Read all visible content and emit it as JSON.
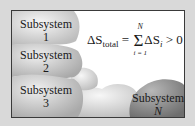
{
  "diagram": {
    "subsystems": [
      {
        "label": "Subsystem",
        "index": "1"
      },
      {
        "label": "Subsystem",
        "index": "2"
      },
      {
        "label": "Subsystem",
        "index": "3"
      },
      {
        "label": "Subsystem",
        "index": "N"
      }
    ],
    "equation": {
      "lhs_delta": "ΔS",
      "lhs_sub": "total",
      "equals": "=",
      "sum_symbol": "Σ",
      "sum_upper": "N",
      "sum_lower": "i = 1",
      "term_delta": "ΔS",
      "term_sub": "i",
      "relation": "> 0"
    },
    "colors": {
      "background": "#d9d9d9",
      "frame_border": "#3a3a3a",
      "subsystem_light": "#e6e6e6",
      "subsystem_mid": "#c8c8c8",
      "subsystem_dark": "#8a8a8a"
    }
  }
}
